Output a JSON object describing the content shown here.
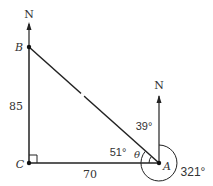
{
  "diagram": {
    "points": {
      "B": {
        "label": "B"
      },
      "C": {
        "label": "C"
      },
      "A": {
        "label": "A"
      }
    },
    "north_labels": {
      "B": "N",
      "A": "N"
    },
    "side_labels": {
      "BC": "85",
      "CA": "70"
    },
    "angle_labels": {
      "north_to_AB": "39°",
      "CAB": "51°",
      "theta": "θ",
      "bearing": "321°"
    },
    "colors": {
      "line": "#222222",
      "text": "#333333",
      "background": "#ffffff"
    }
  }
}
